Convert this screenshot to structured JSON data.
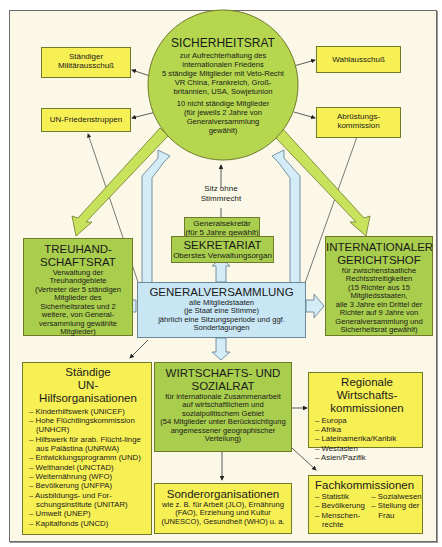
{
  "colors": {
    "background": "#fbf8e8",
    "yellow_box": "#f7f055",
    "green_box": "#a9cd4d",
    "blue_box": "#c8e6f4",
    "arrow_green": "#c9e25c",
    "arrow_blue": "#d4ecf8"
  },
  "sicherheitsrat": {
    "title": "SICHERHEITSRAT",
    "line1": "zur Aufrechterhaltung des",
    "line2": "internationalen Friedens",
    "line3": "5 ständige Mitglieder mit Veto-Recht",
    "line4": "VR China, Frankreich, Groß-",
    "line5": "britannien, USA, Sowjetunion",
    "line6": "10 nicht ständige Mitglieder",
    "line7": "(für jeweils 2 Jahre von",
    "line8": "Generalversammlung",
    "line9": "gewählt)"
  },
  "militaerausschuss": {
    "line1": "Ständiger",
    "line2": "Militärausschuß"
  },
  "friedenstruppen": {
    "label": "UN-Friedenstruppen"
  },
  "wahlausschuss": {
    "label": "Wahlausschuß"
  },
  "abruestung": {
    "line1": "Abrüstungs-",
    "line2": "kommission"
  },
  "sitz_label": {
    "line1": "Sitz ohne",
    "line2": "Stimmrecht"
  },
  "generalsekretaer": {
    "line1": "Generalsekretär",
    "line2": "(für 5 Jahre gewählt)"
  },
  "sekretariat": {
    "title": "SEKRETARIAT",
    "sub": "Oberstes Verwaltungsorgan"
  },
  "treuhandschaftsrat": {
    "title1": "TREUHAND-",
    "title2": "SCHAFTSRAT",
    "line1": "Verwaltung der",
    "line2": "Treuhandgebiete",
    "line3": "(Vertreter der 5 ständigen",
    "line4": "Mitglieder des",
    "line5": "Sicherheitsrates und 2",
    "line6": "weitere, von General-",
    "line7": "versammlung gewählte",
    "line8": "Mitglieder)"
  },
  "gerichtshof": {
    "title1": "INTERNATIONALER",
    "title2": "GERICHTSHOF",
    "line1": "für zwischenstaatliche",
    "line2": "Rechtsstreitigkeiten",
    "line3": "(15 Richter aus 15",
    "line4": "Mitgliedsstaaten,",
    "line5": "alle 3 Jahre ein Drittel der",
    "line6": "Richter auf 9 Jahre von",
    "line7": "Generalversammlung und",
    "line8": "Sicherheitsrat gewählt)"
  },
  "generalversammlung": {
    "title": "GENERALVERSAMMLUNG",
    "line1": "alle Mitgliedstaaten",
    "line2": "(je Staat eine Stimme)",
    "line3": "jährlich eine Sitzungsperiode und ggf.",
    "line4": "Sondertagungen"
  },
  "hilfsorganisationen": {
    "title1": "Ständige",
    "title2": "UN-Hilfsorganisationen",
    "items": [
      "Kinderhilfswerk (UNICEF)",
      "Hohe Flüchtlingskommission (UNHCR)",
      "Hilfswerk für arab. Flücht-linge aus Palästina (UNRWA)",
      "Entwicklungsprogramm (UND)",
      "Welthandel (UNCTAD)",
      "Welternährung (WFO)",
      "Bevölkerung (UNFPA)",
      "Ausbildungs- und For-schungsinstitute (UNITAR)",
      "Umwelt (UNEP)",
      "Kapitalfonds (UNCD)"
    ]
  },
  "wirtschaftsrat": {
    "title1": "WIRTSCHAFTS- UND",
    "title2": "SOZIALRAT",
    "line1": "für internationale Zusammenarbeit",
    "line2": "auf wirtschaftlichem und",
    "line3": "sozialpolitischem Gebiet",
    "line4": "(54 Mitglieder unter Berücksichtigung",
    "line5": "angemessener geographischer",
    "line6": "Verteilung)"
  },
  "sonderorganisationen": {
    "title": "Sonderorganisationen",
    "line1": "wie z. B. für Arbeit (JLO), Ernährung",
    "line2": "(FAO), Erziehung und Kultur",
    "line3": "(UNESCO), Gesundheit (WHO) u. a."
  },
  "regional": {
    "title1": "Regionale Wirtschafts-",
    "title2": "kommissionen",
    "items": [
      "Europa",
      "Afrika",
      "Lateinamerika/Karibik",
      "Westasien",
      "Asien/Pazifik"
    ]
  },
  "fachkommissionen": {
    "title": "Fachkommissionen",
    "col1": [
      "Statistik",
      "Bevölkerung",
      "Menschen-rechte"
    ],
    "col2": [
      "Sozialwesen",
      "Stellung der Frau"
    ]
  }
}
